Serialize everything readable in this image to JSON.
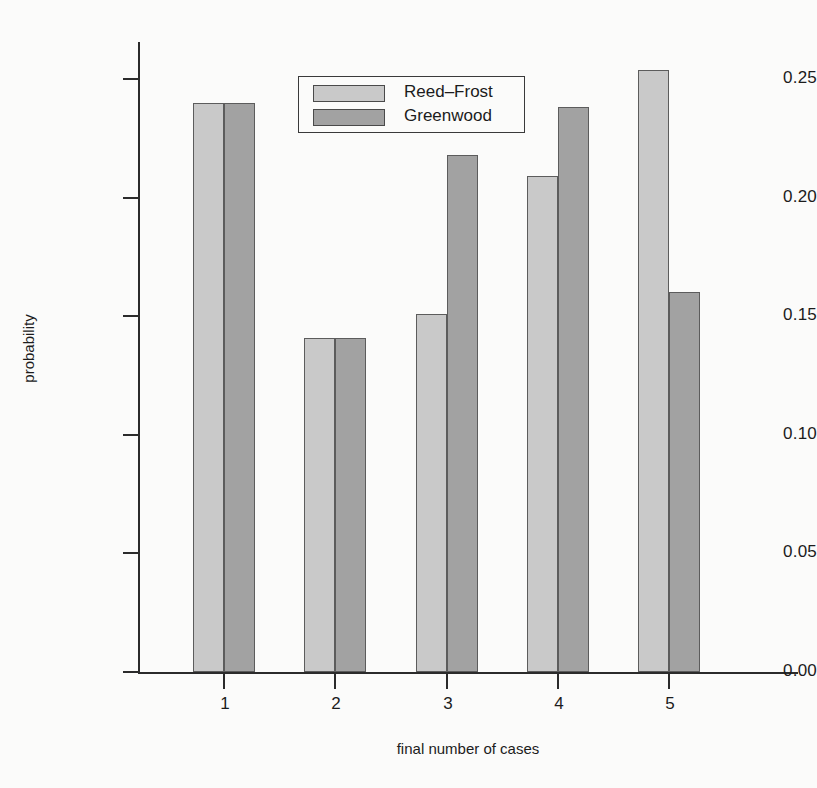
{
  "chart_data": {
    "type": "bar",
    "title": "",
    "xlabel": "final number of cases",
    "ylabel": "probability",
    "categories": [
      "1",
      "2",
      "3",
      "4",
      "5"
    ],
    "series": [
      {
        "name": "Reed–Frost",
        "color": "#c9c9c9",
        "values": [
          0.24,
          0.141,
          0.151,
          0.209,
          0.254
        ]
      },
      {
        "name": "Greenwood",
        "color": "#a2a2a2",
        "values": [
          0.24,
          0.141,
          0.218,
          0.238,
          0.16
        ]
      }
    ],
    "ylim": [
      0.0,
      0.26
    ],
    "yticks": [
      0.0,
      0.05,
      0.1,
      0.15,
      0.2,
      0.25
    ],
    "ytick_labels": [
      "0.00",
      "0.05",
      "0.10",
      "0.15",
      "0.20",
      "0.25"
    ],
    "grid": false,
    "legend_position": "top-center",
    "legend_entries": [
      "Reed–Frost",
      "Greenwood"
    ]
  },
  "axes": {
    "y_title": "probability",
    "x_title": "final number of cases"
  }
}
